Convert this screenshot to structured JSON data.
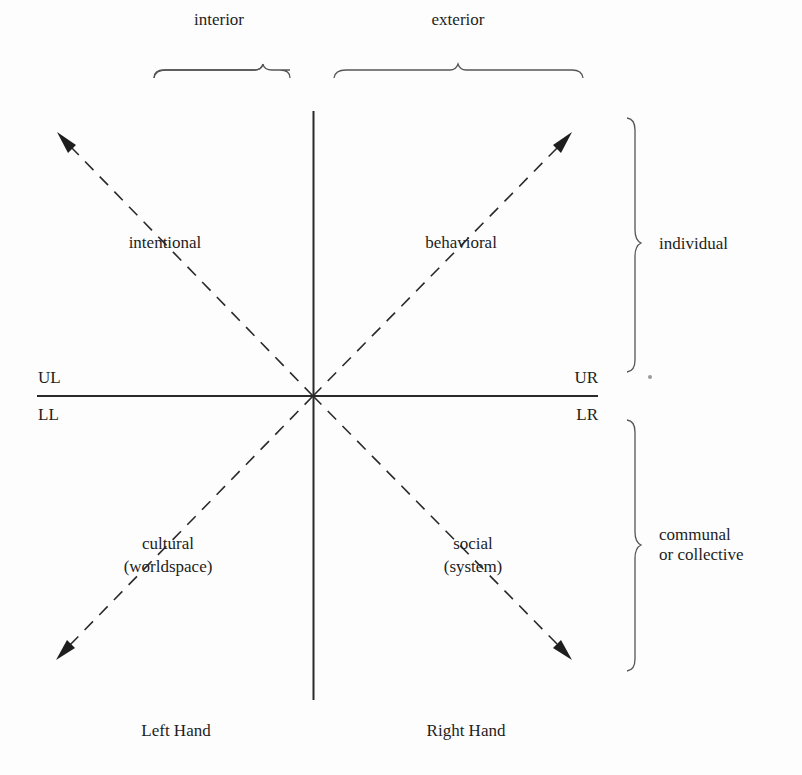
{
  "diagram": {
    "type": "four-quadrant",
    "top_braces": {
      "left": {
        "label": "interior"
      },
      "right": {
        "label": "exterior"
      }
    },
    "side_braces": {
      "top": {
        "label": "individual"
      },
      "bottom": {
        "label_line1": "communal",
        "label_line2": "or collective"
      }
    },
    "quadrant_codes": {
      "upper_left": "UL",
      "upper_right": "UR",
      "lower_left": "LL",
      "lower_right": "LR"
    },
    "quadrants": {
      "upper_left": {
        "label": "intentional"
      },
      "upper_right": {
        "label": "behavioral"
      },
      "lower_left": {
        "label_line1": "cultural",
        "label_line2": "(worldspace)"
      },
      "lower_right": {
        "label_line1": "social",
        "label_line2": "(system)"
      }
    },
    "bottom_labels": {
      "left": "Left Hand",
      "right": "Right Hand"
    },
    "colors": {
      "ink": "#1e1e1e",
      "brace": "#555555",
      "background": "#fdfdfd"
    }
  }
}
